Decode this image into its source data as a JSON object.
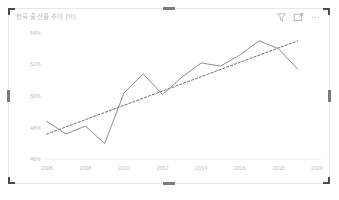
{
  "visual": {
    "title": "한국 출산율 추이 (%)",
    "icons": [
      {
        "name": "filter-icon",
        "label": "Filters"
      },
      {
        "name": "focus-mode-icon",
        "label": "Focus mode"
      },
      {
        "name": "more-options-icon",
        "label": "More options"
      }
    ],
    "selection": {
      "selected": true,
      "handles": [
        "top-left",
        "top-center",
        "top-right",
        "middle-left",
        "middle-right",
        "bottom-left",
        "bottom-center",
        "bottom-right"
      ]
    },
    "colors": {
      "series": "#7f7f86",
      "trend": "#6b6b72",
      "axis": "#e3e3e3",
      "tick_text": "#bdbdbd",
      "border": "#e8e8e8",
      "handle": "#4a4a4a"
    }
  },
  "chart_data": {
    "type": "line",
    "title": "한국 출산율 추이 (%)",
    "xlabel": "",
    "ylabel": "",
    "grid": false,
    "legend": "none",
    "xlim": [
      2006,
      2020
    ],
    "ylim": [
      46,
      54
    ],
    "ytick_labels": [
      "54%",
      "52%",
      "50%",
      "48%",
      "46%"
    ],
    "ytick_values": [
      54,
      52,
      50,
      48,
      46
    ],
    "xtick_labels": [
      "2006",
      "2008",
      "2010",
      "2012",
      "2014",
      "2016",
      "2018",
      "2020"
    ],
    "xtick_values": [
      2006,
      2008,
      2010,
      2012,
      2014,
      2016,
      2018,
      2020
    ],
    "x": [
      2006,
      2007,
      2008,
      2009,
      2010,
      2011,
      2012,
      2013,
      2014,
      2015,
      2016,
      2017,
      2018,
      2019
    ],
    "series": [
      {
        "name": "Value",
        "style": "solid",
        "values": [
          48.4,
          47.6,
          48.1,
          47.0,
          50.2,
          51.4,
          50.1,
          51.2,
          52.1,
          51.9,
          52.6,
          53.5,
          53.0,
          51.7
        ]
      },
      {
        "name": "Trend line",
        "style": "dashed",
        "x": [
          2006,
          2019
        ],
        "values": [
          47.6,
          53.5
        ]
      }
    ]
  }
}
